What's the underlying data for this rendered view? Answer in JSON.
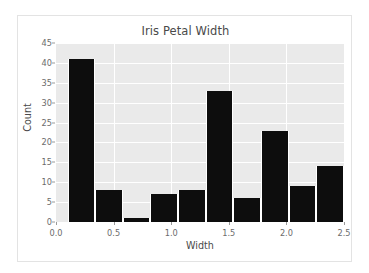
{
  "chart_data": {
    "type": "bar",
    "title": "Iris Petal Width",
    "xlabel": "Width",
    "ylabel": "Count",
    "grid": true,
    "legend": false,
    "xlim": [
      0.0,
      2.5
    ],
    "ylim": [
      0,
      45
    ],
    "xticks": [
      "0.0",
      "0.5",
      "1.0",
      "1.5",
      "2.0",
      "2.5"
    ],
    "xtick_values": [
      0.0,
      0.5,
      1.0,
      1.5,
      2.0,
      2.5
    ],
    "yticks": [
      "0",
      "5",
      "10",
      "15",
      "20",
      "25",
      "30",
      "35",
      "40",
      "45"
    ],
    "ytick_values": [
      0,
      5,
      10,
      15,
      20,
      25,
      30,
      35,
      40,
      45
    ],
    "bin_edges": [
      0.1,
      0.34,
      0.58,
      0.82,
      1.06,
      1.3,
      1.54,
      1.78,
      2.02,
      2.26,
      2.5
    ],
    "categories": [
      "0.10-0.34",
      "0.34-0.58",
      "0.58-0.82",
      "0.82-1.06",
      "1.06-1.30",
      "1.30-1.54",
      "1.54-1.78",
      "1.78-2.02",
      "2.02-2.26",
      "2.26-2.50"
    ],
    "values": [
      41,
      8,
      1,
      7,
      8,
      33,
      6,
      23,
      9,
      14
    ],
    "bar_color": "#0d0d0d",
    "plot_background": "#eaeaea",
    "grid_color": "#ffffff",
    "figure_background": "#ffffff"
  }
}
